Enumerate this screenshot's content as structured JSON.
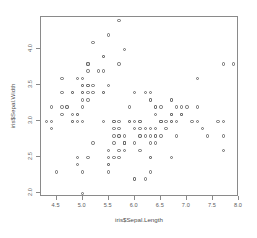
{
  "plot": {
    "xlab": "iris$Sepal.Length",
    "ylab": "iris$Sepal.Width",
    "point_symbol": "open-circle",
    "point_color": "#6b6b6b",
    "frame_color": "#8a8a8a",
    "background": "#ffffff"
  },
  "chart_data": {
    "type": "scatter",
    "title": "",
    "xlabel": "iris$Sepal.Length",
    "ylabel": "iris$Sepal.Width",
    "xlim": [
      4.2,
      8.0
    ],
    "ylim": [
      1.95,
      4.45
    ],
    "xticks": [
      4.5,
      5.0,
      5.5,
      6.0,
      6.5,
      7.0,
      7.5,
      8.0
    ],
    "yticks": [
      2.0,
      2.5,
      3.0,
      3.5,
      4.0
    ],
    "xticklabels": [
      "4.5",
      "5.0",
      "5.5",
      "6.0",
      "6.5",
      "7.0",
      "7.5",
      "8.0"
    ],
    "yticklabels": [
      "2.0",
      "2.5",
      "3.0",
      "3.5",
      "4.0"
    ],
    "grid": false,
    "legend": false,
    "n_points": 150,
    "x": [
      5.1,
      4.9,
      4.7,
      4.6,
      5.0,
      5.4,
      4.6,
      5.0,
      4.4,
      4.9,
      5.4,
      4.8,
      4.8,
      4.3,
      5.8,
      5.7,
      5.4,
      5.1,
      5.7,
      5.1,
      5.4,
      5.1,
      4.6,
      5.1,
      4.8,
      5.0,
      5.0,
      5.2,
      5.2,
      4.7,
      4.8,
      5.4,
      5.2,
      5.5,
      4.9,
      5.0,
      5.5,
      4.9,
      4.4,
      5.1,
      5.0,
      4.5,
      4.4,
      5.0,
      5.1,
      4.8,
      5.1,
      4.6,
      5.3,
      5.0,
      7.0,
      6.4,
      6.9,
      5.5,
      6.5,
      5.7,
      6.3,
      4.9,
      6.6,
      5.2,
      5.0,
      5.9,
      6.0,
      6.1,
      5.6,
      6.7,
      5.6,
      5.8,
      6.2,
      5.6,
      5.9,
      6.1,
      6.3,
      6.1,
      6.4,
      6.6,
      6.8,
      6.7,
      6.0,
      5.7,
      5.5,
      5.5,
      5.8,
      6.0,
      5.4,
      6.0,
      6.7,
      6.3,
      5.6,
      5.5,
      5.5,
      6.1,
      5.8,
      5.0,
      5.6,
      5.7,
      5.7,
      6.2,
      5.1,
      5.7,
      6.3,
      5.8,
      7.1,
      6.3,
      6.5,
      7.6,
      4.9,
      7.3,
      6.7,
      7.2,
      6.5,
      6.4,
      6.8,
      5.7,
      5.8,
      6.4,
      6.5,
      7.7,
      7.7,
      6.0,
      6.9,
      5.6,
      7.7,
      6.3,
      6.7,
      7.2,
      6.2,
      6.1,
      6.4,
      7.2,
      7.4,
      7.9,
      6.4,
      6.3,
      6.1,
      7.7,
      6.3,
      6.4,
      6.0,
      6.9,
      6.7,
      6.9,
      5.8,
      6.8,
      6.7,
      6.7,
      6.3,
      6.5,
      6.2,
      5.9
    ],
    "y": [
      3.5,
      3.0,
      3.2,
      3.1,
      3.6,
      3.9,
      3.4,
      3.4,
      2.9,
      3.1,
      3.7,
      3.4,
      3.0,
      3.0,
      4.0,
      4.4,
      3.9,
      3.5,
      3.8,
      3.8,
      3.4,
      3.7,
      3.6,
      3.3,
      3.4,
      3.0,
      3.4,
      3.5,
      3.4,
      3.2,
      3.1,
      3.4,
      4.1,
      4.2,
      3.1,
      3.2,
      3.5,
      3.6,
      3.0,
      3.4,
      3.5,
      2.3,
      3.2,
      3.5,
      3.8,
      3.0,
      3.8,
      3.2,
      3.7,
      3.3,
      3.2,
      3.2,
      3.1,
      2.3,
      2.8,
      2.8,
      3.3,
      2.4,
      2.9,
      2.7,
      2.0,
      3.0,
      2.2,
      2.9,
      2.9,
      3.1,
      3.0,
      2.7,
      2.2,
      2.5,
      3.2,
      2.8,
      2.5,
      2.8,
      2.9,
      3.0,
      2.8,
      3.0,
      2.9,
      2.6,
      2.4,
      2.4,
      2.7,
      2.7,
      3.0,
      3.4,
      3.1,
      2.3,
      3.0,
      2.5,
      2.6,
      3.0,
      2.6,
      2.3,
      2.7,
      3.0,
      2.9,
      2.9,
      2.5,
      2.8,
      3.3,
      2.7,
      3.0,
      2.9,
      3.0,
      3.0,
      2.5,
      2.9,
      2.5,
      3.6,
      3.2,
      2.7,
      3.0,
      2.5,
      2.8,
      3.2,
      3.0,
      3.8,
      2.6,
      2.2,
      3.2,
      2.8,
      2.8,
      2.7,
      3.3,
      3.2,
      2.8,
      3.0,
      2.8,
      3.0,
      2.8,
      3.8,
      2.8,
      2.8,
      2.6,
      3.0,
      3.4,
      3.1,
      3.0,
      3.1,
      3.1,
      3.1,
      2.7,
      3.2,
      3.3,
      3.0,
      2.5,
      3.0,
      3.4,
      3.0
    ]
  }
}
